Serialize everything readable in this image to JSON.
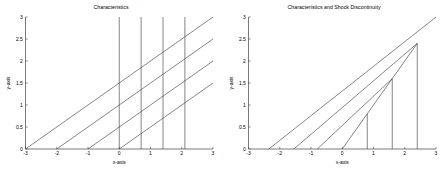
{
  "figure": {
    "background": "#ffffff",
    "line_color": "#3a3a3a",
    "axis_color": "#4d4d4d",
    "text_color": "#000000"
  },
  "panels": {
    "left": {
      "title": "Characteristics",
      "xlabel": "x-axis",
      "ylabel": "y-axis"
    },
    "right": {
      "title": "Characteristics and Shock Discontinuity",
      "xlabel": "x-axis",
      "ylabel": "y-axis"
    }
  },
  "chart_data": [
    {
      "type": "line",
      "title": "Characteristics",
      "xlabel": "x-axis",
      "ylabel": "y-axis",
      "xlim": [
        -3,
        3
      ],
      "ylim": [
        0,
        3
      ],
      "xticks": [
        -3,
        -2,
        -1,
        0,
        1,
        2,
        3
      ],
      "xticklabels": [
        "-3",
        "-2",
        "-1",
        "0",
        "1",
        "2",
        "3"
      ],
      "yticks": [
        0,
        0.5,
        1,
        1.5,
        2,
        2.5,
        3
      ],
      "yticklabels": [
        "0",
        "0.5",
        "1",
        "1.5",
        "2",
        "2.5",
        "3"
      ],
      "grid": false,
      "legend": false,
      "series": [
        {
          "name": "characteristic-1",
          "kind": "diagonal",
          "x": [
            -3,
            3
          ],
          "y": [
            0,
            3
          ]
        },
        {
          "name": "characteristic-2",
          "kind": "diagonal",
          "x": [
            -2,
            3
          ],
          "y": [
            0,
            2.5
          ]
        },
        {
          "name": "characteristic-3",
          "kind": "diagonal",
          "x": [
            -1,
            3
          ],
          "y": [
            0,
            2.0
          ]
        },
        {
          "name": "characteristic-4",
          "kind": "diagonal",
          "x": [
            0,
            3
          ],
          "y": [
            0,
            1.5
          ]
        },
        {
          "name": "vertical-1",
          "kind": "vertical",
          "x": [
            0,
            0
          ],
          "y": [
            0,
            3
          ]
        },
        {
          "name": "vertical-2",
          "kind": "vertical",
          "x": [
            0.7,
            0.7
          ],
          "y": [
            0,
            3
          ]
        },
        {
          "name": "vertical-3",
          "kind": "vertical",
          "x": [
            1.4,
            1.4
          ],
          "y": [
            0,
            3
          ]
        },
        {
          "name": "vertical-4",
          "kind": "vertical",
          "x": [
            2.1,
            2.1
          ],
          "y": [
            0,
            3
          ]
        }
      ]
    },
    {
      "type": "line",
      "title": "Characteristics and Shock Discontinuity",
      "xlabel": "x-axis",
      "ylabel": "y-axis",
      "xlim": [
        -3,
        3
      ],
      "ylim": [
        0,
        3
      ],
      "xticks": [
        -3,
        -2,
        -1,
        0,
        1,
        2,
        3
      ],
      "xticklabels": [
        "-3",
        "-2",
        "-1",
        "0",
        "1",
        "2",
        "3"
      ],
      "yticks": [
        0,
        0.5,
        1,
        1.5,
        2,
        2.5,
        3
      ],
      "yticklabels": [
        "0",
        "0.5",
        "1",
        "1.5",
        "2",
        "2.5",
        "3"
      ],
      "grid": false,
      "legend": false,
      "series": [
        {
          "name": "characteristic-1",
          "kind": "diagonal",
          "x": [
            -2.35,
            3
          ],
          "y": [
            0,
            3
          ]
        },
        {
          "name": "characteristic-2",
          "kind": "diagonal",
          "x": [
            -1.55,
            2.4
          ],
          "y": [
            0,
            2.4
          ]
        },
        {
          "name": "characteristic-3",
          "kind": "diagonal",
          "x": [
            -0.8,
            1.6
          ],
          "y": [
            0,
            1.6
          ]
        },
        {
          "name": "characteristic-4",
          "kind": "diagonal",
          "x": [
            0,
            0.8
          ],
          "y": [
            0,
            0.8
          ]
        },
        {
          "name": "shock-curve",
          "kind": "shock",
          "x": [
            0.8,
            1.6,
            2.4
          ],
          "y": [
            0.8,
            1.6,
            2.4
          ]
        },
        {
          "name": "vertical-1",
          "kind": "vertical",
          "x": [
            0.8,
            0.8
          ],
          "y": [
            0,
            0.8
          ]
        },
        {
          "name": "vertical-2",
          "kind": "vertical",
          "x": [
            1.6,
            1.6
          ],
          "y": [
            0,
            1.6
          ]
        },
        {
          "name": "vertical-3",
          "kind": "vertical",
          "x": [
            2.4,
            2.4
          ],
          "y": [
            0,
            2.4
          ]
        }
      ]
    }
  ]
}
